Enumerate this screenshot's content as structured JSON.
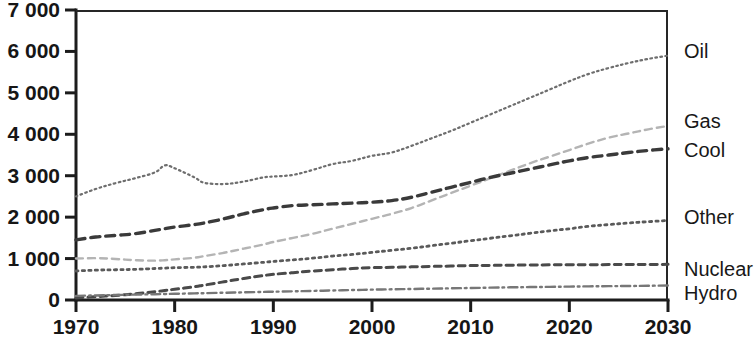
{
  "chart_data": {
    "type": "line",
    "title": "",
    "subtitle": "",
    "xlabel": "",
    "ylabel": "",
    "xlim": [
      1970,
      2030
    ],
    "ylim": [
      0,
      7000
    ],
    "grid": false,
    "legend_position": "right-outside-line-end",
    "x_tick_labels": [
      "1970",
      "1980",
      "1990",
      "2000",
      "2010",
      "2020",
      "2030"
    ],
    "x_ticks": [
      1970,
      1980,
      1990,
      2000,
      2010,
      2020,
      2030
    ],
    "y_tick_labels": [
      "0",
      "1 000",
      "2 000",
      "3 000",
      "4 000",
      "5 000",
      "6 000",
      "7 000"
    ],
    "y_ticks": [
      0,
      1000,
      2000,
      3000,
      4000,
      5000,
      6000,
      7000
    ],
    "x": [
      1970,
      1972,
      1974,
      1976,
      1978,
      1979,
      1980,
      1982,
      1983,
      1985,
      1987,
      1989,
      1990,
      1992,
      1994,
      1996,
      1998,
      2000,
      2002,
      2004,
      2006,
      2008,
      2010,
      2012,
      2014,
      2016,
      2018,
      2020,
      2022,
      2024,
      2026,
      2028,
      2030
    ],
    "series": [
      {
        "name": "Oil",
        "label": "Oil",
        "line_style": "dotted-fine",
        "color": "#6e6e6e",
        "values": [
          2500,
          2680,
          2820,
          2940,
          3080,
          3250,
          3180,
          2960,
          2830,
          2800,
          2860,
          2960,
          2980,
          3020,
          3140,
          3280,
          3360,
          3480,
          3560,
          3720,
          3900,
          4080,
          4280,
          4480,
          4680,
          4880,
          5080,
          5280,
          5460,
          5600,
          5720,
          5820,
          5900
        ]
      },
      {
        "name": "Gas",
        "label": "Gas",
        "line_style": "dashed-light",
        "color": "#b4b4b4",
        "values": [
          1000,
          1010,
          990,
          960,
          950,
          960,
          980,
          1020,
          1060,
          1140,
          1240,
          1340,
          1400,
          1500,
          1600,
          1720,
          1840,
          1960,
          2080,
          2220,
          2400,
          2580,
          2760,
          2940,
          3120,
          3300,
          3460,
          3620,
          3780,
          3920,
          4020,
          4120,
          4200
        ]
      },
      {
        "name": "Cool",
        "label": "Cool",
        "line_style": "dashed-dark",
        "color": "#3a3a3a",
        "values": [
          1450,
          1520,
          1560,
          1600,
          1680,
          1720,
          1760,
          1820,
          1860,
          1960,
          2080,
          2180,
          2220,
          2280,
          2300,
          2320,
          2340,
          2360,
          2400,
          2480,
          2600,
          2720,
          2840,
          2960,
          3060,
          3160,
          3260,
          3360,
          3440,
          3500,
          3560,
          3610,
          3650
        ]
      },
      {
        "name": "Other",
        "label": "Other",
        "line_style": "dotted-medium",
        "color": "#5a5a5a",
        "values": [
          700,
          720,
          730,
          740,
          760,
          770,
          780,
          790,
          800,
          830,
          870,
          910,
          930,
          970,
          1010,
          1060,
          1100,
          1150,
          1200,
          1250,
          1310,
          1370,
          1430,
          1490,
          1550,
          1610,
          1670,
          1720,
          1780,
          1820,
          1860,
          1890,
          1920
        ]
      },
      {
        "name": "Nuclear",
        "label": "Nuclear",
        "line_style": "dashed-short",
        "color": "#4a4a4a",
        "values": [
          50,
          80,
          110,
          150,
          200,
          230,
          260,
          320,
          360,
          440,
          520,
          590,
          620,
          660,
          700,
          730,
          760,
          780,
          790,
          800,
          810,
          820,
          830,
          835,
          840,
          845,
          848,
          850,
          852,
          854,
          856,
          858,
          860
        ]
      },
      {
        "name": "Hydro",
        "label": "Hydro",
        "line_style": "dash-dot",
        "color": "#777777",
        "values": [
          100,
          110,
          120,
          130,
          140,
          145,
          150,
          160,
          165,
          175,
          185,
          195,
          200,
          210,
          220,
          230,
          240,
          250,
          258,
          266,
          274,
          282,
          290,
          298,
          306,
          312,
          318,
          324,
          330,
          334,
          338,
          344,
          350
        ]
      }
    ],
    "series_label_values": {
      "Oil": 5900,
      "Gas": 4200,
      "Cool": 3650,
      "Other": 1920,
      "Nuclear": 860,
      "Hydro": 350
    }
  }
}
